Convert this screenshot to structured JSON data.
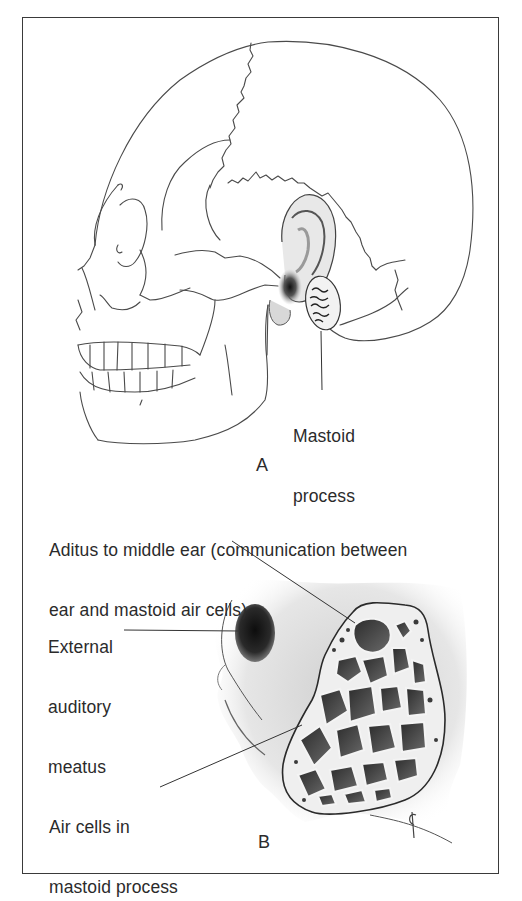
{
  "figure": {
    "panels": [
      {
        "id": "A",
        "letter": "A",
        "subject": "Lateral view of skull with ear, showing location of mastoid process",
        "labels": [
          {
            "line1": "Mastoid",
            "line2": "process"
          }
        ]
      },
      {
        "id": "B",
        "letter": "B",
        "subject": "Close-up of ear region with mastoid process cut open showing air cells",
        "labels": [
          {
            "line1": "Aditus to middle ear (communication between",
            "line2": "ear and mastoid air cells)"
          },
          {
            "line1": "External",
            "line2": "auditory",
            "line3": "meatus"
          },
          {
            "line1": "Air cells in",
            "line2": "mastoid process"
          }
        ],
        "signature": "¢"
      }
    ],
    "colors": {
      "line": "#3a3a3a",
      "shade_dark": "#1e1e1e",
      "shade_mid": "#8a8a8a",
      "background": "#ffffff"
    }
  }
}
